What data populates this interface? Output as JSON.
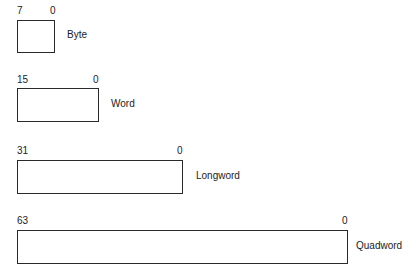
{
  "diagram": {
    "units": [
      {
        "name": "Byte",
        "high_bit": "7",
        "low_bit": "0"
      },
      {
        "name": "Word",
        "high_bit": "15",
        "low_bit": "0"
      },
      {
        "name": "Longword",
        "high_bit": "31",
        "low_bit": "0"
      },
      {
        "name": "Quadword",
        "high_bit": "63",
        "low_bit": "0"
      }
    ],
    "colors": {
      "line": "#2a2a2a",
      "text": "#222222",
      "background": "#ffffff"
    }
  }
}
